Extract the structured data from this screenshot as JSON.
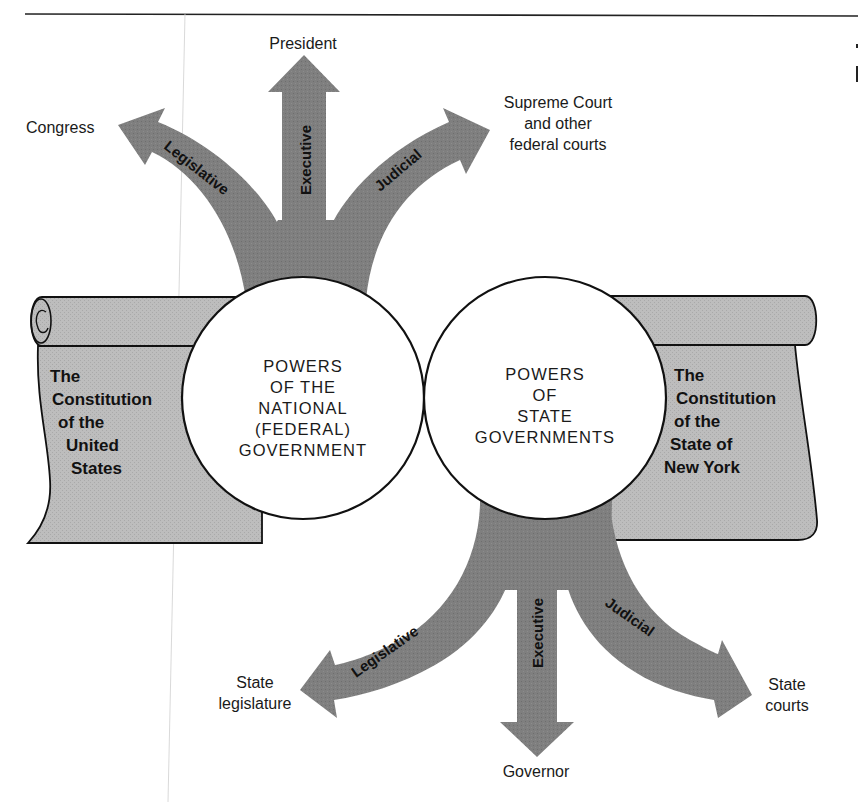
{
  "diagram": {
    "colors": {
      "arrow_fill": "#7d7d7d",
      "scroll_fill": "#b7b7b7",
      "circle_fill": "#ffffff",
      "outline": "#111111",
      "background": "#ffffff"
    },
    "circles": {
      "national": {
        "lines": [
          "POWERS",
          "OF THE",
          "NATIONAL",
          "(FEDERAL)",
          "GOVERNMENT"
        ]
      },
      "state": {
        "lines": [
          "POWERS",
          "OF",
          "STATE",
          "GOVERNMENTS"
        ]
      }
    },
    "scrolls": {
      "us_constitution": {
        "lines": [
          "The",
          "Constitution",
          "of the",
          "United",
          "States"
        ]
      },
      "ny_constitution": {
        "lines": [
          "The",
          "Constitution",
          "of the",
          "State of",
          "New York"
        ]
      }
    },
    "national_branches": [
      {
        "branch": "Legislative",
        "target": "Congress"
      },
      {
        "branch": "Executive",
        "target": "President"
      },
      {
        "branch": "Judicial",
        "target_lines": [
          "Supreme Court",
          "and other",
          "federal courts"
        ]
      }
    ],
    "state_branches": [
      {
        "branch": "Legislative",
        "target_lines": [
          "State",
          "legislature"
        ]
      },
      {
        "branch": "Executive",
        "target": "Governor"
      },
      {
        "branch": "Judicial",
        "target_lines": [
          "State",
          "courts"
        ]
      }
    ]
  }
}
